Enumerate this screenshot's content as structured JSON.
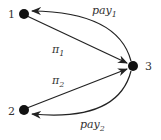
{
  "diagram": {
    "nodes": [
      {
        "id": "1",
        "label": "1",
        "x": 24,
        "y": 14
      },
      {
        "id": "2",
        "label": "2",
        "x": 24,
        "y": 110
      },
      {
        "id": "3",
        "label": "3",
        "x": 133,
        "y": 66
      }
    ],
    "edges": [
      {
        "from": "1",
        "to": "3",
        "label": "π",
        "subscript": "1",
        "style": "straight"
      },
      {
        "from": "3",
        "to": "1",
        "label": "pay",
        "subscript": "1",
        "style": "curved"
      },
      {
        "from": "2",
        "to": "3",
        "label": "π",
        "subscript": "2",
        "style": "straight"
      },
      {
        "from": "3",
        "to": "2",
        "label": "pay",
        "subscript": "2",
        "style": "curved"
      }
    ],
    "colors": {
      "node": "#111111",
      "edge": "#222222",
      "text": "#333333"
    }
  }
}
